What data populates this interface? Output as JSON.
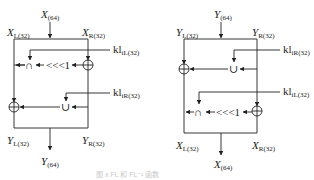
{
  "diagram": {
    "left": {
      "name": "FL function",
      "input": {
        "base": "X",
        "sub": "(64)"
      },
      "split_left": {
        "base": "X",
        "sub": "L(32)"
      },
      "split_right": {
        "base": "X",
        "sub": "R(32)"
      },
      "key_top": {
        "base": "kl",
        "sub": "iL(32)"
      },
      "key_bottom": {
        "base": "kl",
        "sub": "iR(32)"
      },
      "rotate_label": "<<<1",
      "ops": {
        "and": "∩",
        "or": "∪",
        "xor": "⊕"
      },
      "out_left": {
        "base": "Y",
        "sub": "L(32)"
      },
      "out_right": {
        "base": "Y",
        "sub": "R(32)"
      },
      "output": {
        "base": "Y",
        "sub": "(64)"
      }
    },
    "right": {
      "name": "FL inverse function",
      "input": {
        "base": "Y",
        "sub": "(64)"
      },
      "split_left": {
        "base": "Y",
        "sub": "L(32)"
      },
      "split_right": {
        "base": "Y",
        "sub": "R(32)"
      },
      "key_top": {
        "base": "kl",
        "sub": "iR(32)"
      },
      "key_bottom": {
        "base": "kl",
        "sub": "iL(32)"
      },
      "rotate_label": "<<<1",
      "ops": {
        "and": "∩",
        "or": "∪",
        "xor": "⊕"
      },
      "out_left": {
        "base": "X",
        "sub": "L(32)"
      },
      "out_right": {
        "base": "X",
        "sub": "R(32)"
      },
      "output": {
        "base": "X",
        "sub": "(64)"
      }
    },
    "caption": "图 x   FL 和 FL⁻¹ 函数"
  }
}
